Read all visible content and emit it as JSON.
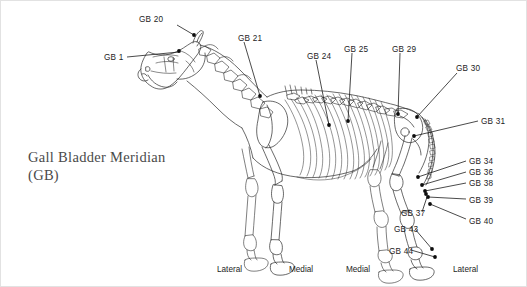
{
  "figure": {
    "title_line_1": "Gall Bladder Meridian",
    "title_line_2": "(GB)",
    "ink_color": "#1d1d1d",
    "title_color": "#4a4a4a",
    "background_color": "#ffffff",
    "border_color": "#e2e2e2",
    "width": 527,
    "height": 287
  },
  "points": [
    {
      "label": "GB 20",
      "lx": 138,
      "ly": 15,
      "px": 193,
      "py": 34,
      "leader": "M 176 24 L 193 34",
      "anchor": "start"
    },
    {
      "label": "GB 1",
      "lx": 103,
      "ly": 53,
      "px": 178,
      "py": 50,
      "leader": "M 126 56 L 178 51",
      "anchor": "start"
    },
    {
      "label": "GB 21",
      "lx": 237,
      "ly": 34,
      "px": 259,
      "py": 95,
      "leader": "M 243 41 L 259 95",
      "anchor": "start"
    },
    {
      "label": "GB 24",
      "lx": 306,
      "ly": 52,
      "px": 328,
      "py": 124,
      "leader": "M 315 59 L 328 124",
      "anchor": "start"
    },
    {
      "label": "GB 25",
      "lx": 343,
      "ly": 45,
      "px": 347,
      "py": 120,
      "leader": "M 351 52 L 347 120",
      "anchor": "start"
    },
    {
      "label": "GB 29",
      "lx": 391,
      "ly": 45,
      "px": 397,
      "py": 113,
      "leader": "M 399 52 L 397 113",
      "anchor": "start"
    },
    {
      "label": "GB 30",
      "lx": 455,
      "ly": 64,
      "px": 416,
      "py": 116,
      "leader": "M 456 72 L 416 116",
      "anchor": "start"
    },
    {
      "label": "GB 31",
      "lx": 480,
      "ly": 117,
      "px": 413,
      "py": 135,
      "leader": "M 477 120 L 413 135",
      "anchor": "start"
    },
    {
      "label": "GB 34",
      "lx": 468,
      "ly": 157,
      "px": 417,
      "py": 176,
      "leader": "M 465 160 L 417 176",
      "anchor": "start"
    },
    {
      "label": "GB 36",
      "lx": 468,
      "ly": 168,
      "px": 421,
      "py": 184,
      "leader": "M 465 171 L 421 184",
      "anchor": "start"
    },
    {
      "label": "GB 38",
      "lx": 468,
      "ly": 179,
      "px": 424,
      "py": 190,
      "leader": "M 465 182 L 424 190",
      "anchor": "start"
    },
    {
      "label": "GB 39",
      "lx": 468,
      "ly": 196,
      "px": 427,
      "py": 196,
      "leader": "M 465 198 L 427 196",
      "anchor": "start"
    },
    {
      "label": "GB 40",
      "lx": 468,
      "ly": 217,
      "px": 429,
      "py": 203,
      "leader": "M 465 218 L 429 203",
      "anchor": "start"
    },
    {
      "label": "GB 37",
      "lx": 400,
      "ly": 209,
      "px": 425,
      "py": 193,
      "leader": "M 421 211 L 426 196",
      "anchor": "start"
    },
    {
      "label": "GB 43",
      "lx": 393,
      "ly": 225,
      "px": 431,
      "py": 248,
      "leader": "M 414 228 L 431 248",
      "anchor": "start"
    },
    {
      "label": "GB 44",
      "lx": 388,
      "ly": 247,
      "px": 434,
      "py": 256,
      "leader": "M 410 249 L 434 256",
      "anchor": "start"
    }
  ],
  "orientation_labels": [
    {
      "text": "Lateral",
      "lx": 216,
      "ly": 265
    },
    {
      "text": "Medial",
      "lx": 288,
      "ly": 265
    },
    {
      "text": "Medial",
      "lx": 345,
      "ly": 265
    },
    {
      "text": "Lateral",
      "lx": 452,
      "ly": 265
    }
  ]
}
